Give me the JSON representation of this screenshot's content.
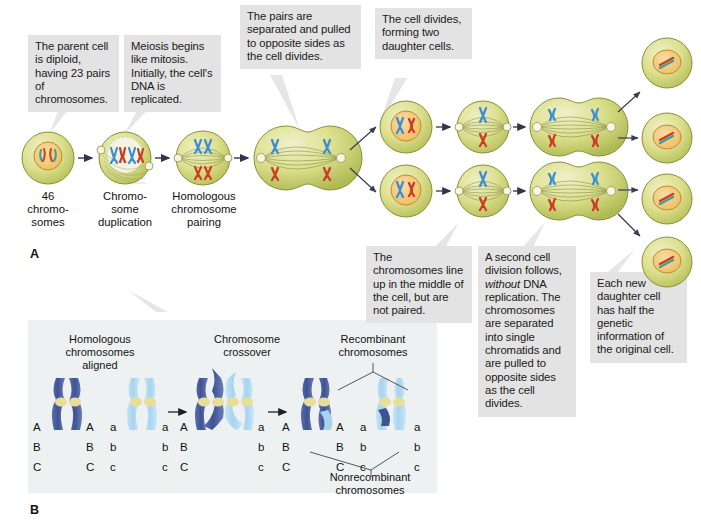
{
  "figure": {
    "panel_a_letter": "A",
    "panel_b_letter": "B"
  },
  "panel_a": {
    "callouts": [
      {
        "id": "parent-cell",
        "text": "The parent cell is diploid, having 23 pairs of chromosomes."
      },
      {
        "id": "meiosis-begins",
        "text": "Meiosis begins like mitosis. Initially, the cell's DNA is replicated."
      },
      {
        "id": "pairs-separated",
        "text": "The pairs are separated and pulled to opposite sides as the cell divides."
      },
      {
        "id": "cell-divides",
        "text": "The cell divides, forming two daughter cells."
      },
      {
        "id": "chromosomes-line-up",
        "text": "The chromosomes line up in the middle of the cell, but are not paired."
      },
      {
        "id": "second-division",
        "text": "A second cell division follows, without DNA replication. The chromosomes are separated into single chromatids and are pulled to opposite sides as the cell divides."
      },
      {
        "id": "each-daughter",
        "text": "Each new daughter cell has half the genetic information of the original cell."
      }
    ],
    "second_division_parts": {
      "before_italic": "A second cell division follows, ",
      "italic": "without",
      "after_italic": " DNA replication. The chromosomes are separated into single chromatids and are pulled to opposite sides as the cell divides."
    },
    "stage_captions": [
      {
        "id": "stage-1",
        "lines": [
          "46",
          "chromo-",
          "somes"
        ]
      },
      {
        "id": "stage-2",
        "lines": [
          "Chromo-",
          "some",
          "duplication"
        ]
      },
      {
        "id": "stage-3",
        "lines": [
          "Homologous",
          "chromosome",
          "pairing"
        ]
      }
    ]
  },
  "panel_b": {
    "headings": [
      {
        "id": "homologous-aligned",
        "lines": [
          "Homologous",
          "chromosomes",
          "aligned"
        ]
      },
      {
        "id": "chromosome-crossover",
        "lines": [
          "Chromosome",
          "crossover"
        ]
      },
      {
        "id": "recombinant",
        "lines": [
          "Recombinant",
          "chromosomes"
        ]
      }
    ],
    "footer_heading": {
      "id": "nonrecombinant",
      "lines": [
        "Nonrecombinant",
        "chromosomes"
      ]
    },
    "alleles": {
      "dark_left": [
        "A",
        "B",
        "C"
      ],
      "dark_right": [
        "A",
        "B",
        "C"
      ],
      "light_left": [
        "a",
        "b",
        "c"
      ],
      "light_right": [
        "a",
        "b",
        "c"
      ]
    }
  },
  "colors": {
    "callout_bg": "#e3e3e3",
    "panel_b_bg": "#eef1f2",
    "cell_body": "#d9dc8f",
    "cell_body_dark": "#bcc460",
    "cell_outline": "#8a8f3a",
    "nucleus": "#f0c56a",
    "nucleus_outline": "#c98a2a",
    "chromosome_blue": "#3f8fd0",
    "chromosome_red": "#cc3b22",
    "chromosome_teal": "#3f9e9e",
    "chromatid_dark_blue": "#4a5fa0",
    "chromatid_light_blue": "#a9d6ef",
    "centromere": "#e9dd9a",
    "arrow": "#3a3a55",
    "text": "#111111"
  }
}
